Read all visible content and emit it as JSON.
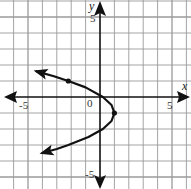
{
  "chart_data": {
    "type": "line",
    "title": "",
    "xlabel": "x",
    "ylabel": "y",
    "xlim": [
      -6.9,
      6.2
    ],
    "ylim": [
      -5.7,
      6.0
    ],
    "grid": true,
    "legend": null,
    "tick_labels": {
      "x": [
        {
          "value": -5,
          "label": "-5"
        },
        {
          "value": 0,
          "label": "0"
        },
        {
          "value": 5,
          "label": "5"
        }
      ],
      "y": [
        {
          "value": 5,
          "label": "5"
        },
        {
          "value": -5,
          "label": "-5"
        }
      ]
    },
    "series": [
      {
        "name": "parabola opening left",
        "equation_approx": "x = -(y+1)^2 + 1",
        "vertex": [
          1,
          -1
        ],
        "arrows_at_ends": true,
        "points": [
          [
            -4.41,
            1.6
          ],
          [
            -3.2,
            1.3
          ],
          [
            -2.2,
            1.0
          ],
          [
            -1.0,
            0.6
          ],
          [
            0.2,
            0.0
          ],
          [
            0.8,
            -0.5
          ],
          [
            1.0,
            -1.0
          ],
          [
            0.8,
            -1.5
          ],
          [
            0.2,
            -2.0
          ],
          [
            -0.8,
            -2.5
          ],
          [
            -2.2,
            -3.0
          ],
          [
            -3.0,
            -3.25
          ],
          [
            -4.0,
            -3.5
          ]
        ],
        "marked_points": [
          [
            1,
            -1
          ],
          [
            -2.2,
            1.0
          ]
        ]
      }
    ]
  },
  "labels": {
    "x_axis_name": "x",
    "y_axis_name": "y",
    "x_neg5": "-5",
    "x_zero": "0",
    "x_pos5": "5",
    "y_pos5": "5",
    "y_neg5": "-5"
  },
  "colors": {
    "grid": "#9a9a9a",
    "axis": "#111111",
    "curve": "#111111",
    "background": "#ffffff"
  }
}
